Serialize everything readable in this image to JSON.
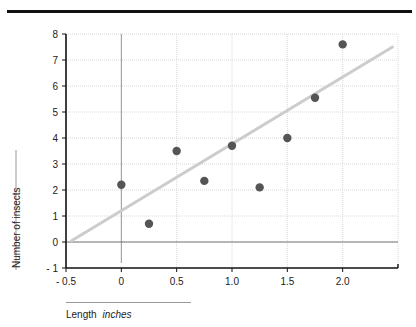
{
  "chart_data": {
    "type": "scatter",
    "title": "",
    "xlabel": "Length",
    "xlabel_unit": "inches",
    "ylabel": "Number of insects",
    "xlim": [
      -0.5,
      2.5
    ],
    "ylim": [
      -1,
      8
    ],
    "x_ticks": [
      "- 0.5",
      "0",
      "0.5",
      "1.0",
      "1.5",
      "2.0"
    ],
    "y_ticks": [
      "- 1",
      "0",
      "1",
      "2",
      "3",
      "4",
      "5",
      "6",
      "7",
      "8"
    ],
    "grid": true,
    "series": [
      {
        "name": "observations",
        "x": [
          0,
          0.25,
          0.5,
          0.75,
          1.0,
          1.25,
          1.5,
          1.75,
          2.0
        ],
        "y": [
          2.2,
          0.7,
          3.5,
          2.35,
          3.7,
          2.1,
          4.0,
          5.55,
          7.6
        ]
      }
    ],
    "trendline": {
      "x": [
        -0.45,
        2.45
      ],
      "y": [
        0.05,
        7.5
      ]
    },
    "colors": {
      "points": "#555555",
      "trendline": "#cccccc",
      "axis": "#111111",
      "grid": "#d8d8d8"
    }
  },
  "labels": {
    "ylabel": "Number of insects",
    "xlabel": "Length",
    "xunit": "inches"
  }
}
